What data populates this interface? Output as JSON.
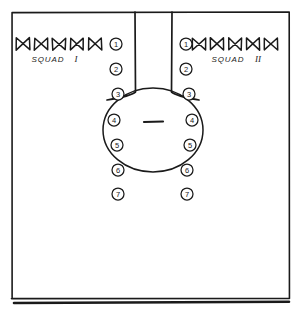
{
  "diagram": {
    "background_color": "#ffffff",
    "ink_color": "#1a1a1a"
  },
  "squads": [
    {
      "id": "squad-1",
      "label": "SQUAD",
      "numeral": "I",
      "side": "left",
      "marker_icon": "bowtie-icon",
      "marker_count": 5,
      "label_x": 48,
      "label_y": 62,
      "numeral_x": 76,
      "numeral_y": 62,
      "markers": [
        {
          "cx": 23,
          "cy": 44
        },
        {
          "cx": 41,
          "cy": 44
        },
        {
          "cx": 59,
          "cy": 44
        },
        {
          "cx": 77,
          "cy": 44
        },
        {
          "cx": 95,
          "cy": 44
        }
      ]
    },
    {
      "id": "squad-2",
      "label": "SQUAD",
      "numeral": "II",
      "side": "right",
      "marker_icon": "bowtie-icon",
      "marker_count": 5,
      "label_x": 228,
      "label_y": 62,
      "numeral_x": 258,
      "numeral_y": 62,
      "markers": [
        {
          "cx": 199,
          "cy": 44
        },
        {
          "cx": 217,
          "cy": 44
        },
        {
          "cx": 235,
          "cy": 44
        },
        {
          "cx": 253,
          "cy": 44
        },
        {
          "cx": 271,
          "cy": 44
        }
      ]
    }
  ],
  "position_markers": {
    "radius": 6,
    "left_column": [
      {
        "number": "1",
        "cx": 116,
        "cy": 44
      },
      {
        "number": "2",
        "cx": 116,
        "cy": 69
      },
      {
        "number": "3",
        "cx": 118,
        "cy": 94
      },
      {
        "number": "4",
        "cx": 114,
        "cy": 120
      },
      {
        "number": "5",
        "cx": 117,
        "cy": 145
      },
      {
        "number": "6",
        "cx": 118,
        "cy": 170
      },
      {
        "number": "7",
        "cx": 118,
        "cy": 194
      }
    ],
    "right_column": [
      {
        "number": "1",
        "cx": 186,
        "cy": 44
      },
      {
        "number": "2",
        "cx": 186,
        "cy": 69
      },
      {
        "number": "3",
        "cx": 189,
        "cy": 94
      },
      {
        "number": "4",
        "cx": 192,
        "cy": 120
      },
      {
        "number": "5",
        "cx": 190,
        "cy": 145
      },
      {
        "number": "6",
        "cx": 187,
        "cy": 170
      },
      {
        "number": "7",
        "cx": 187,
        "cy": 194
      }
    ]
  },
  "frame": {
    "name": "outer-frame",
    "left": 12,
    "top": 12,
    "right": 289,
    "bottom": 298,
    "baseline_y": 303,
    "baseline_left": 14,
    "baseline_right": 289
  },
  "corridor": {
    "name": "center-corridor",
    "left_x": 135,
    "right_x": 172,
    "top_y": 12,
    "bottom_y": 92
  },
  "center_ring": {
    "name": "formation-ring",
    "cx": 153,
    "cy": 130,
    "rx": 50,
    "ry": 42
  },
  "center_dash": {
    "name": "center-dash",
    "x1": 144,
    "x2": 163,
    "y": 122
  }
}
